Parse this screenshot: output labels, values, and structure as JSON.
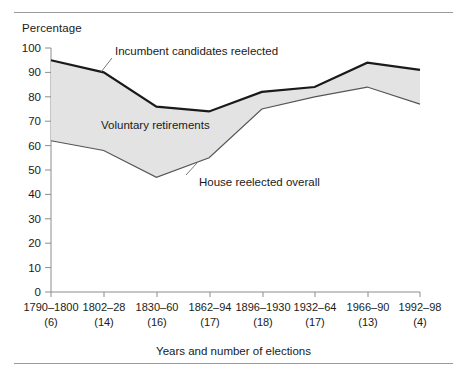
{
  "chart_data": {
    "type": "area",
    "title": "",
    "xlabel": "Years and number of elections",
    "ylabel": "Percentage",
    "ylim": [
      0,
      100
    ],
    "yticks": [
      0,
      10,
      20,
      30,
      40,
      50,
      60,
      70,
      80,
      90,
      100
    ],
    "grid": false,
    "legend_position": "inline-annotations",
    "categories": [
      "1790–1800",
      "1802–28",
      "1830–60",
      "1862–94",
      "1896–1930",
      "1932–64",
      "1966–90",
      "1992–98"
    ],
    "category_sublabels": [
      "(6)",
      "(14)",
      "(16)",
      "(17)",
      "(18)",
      "(17)",
      "(13)",
      "(4)"
    ],
    "series": [
      {
        "name": "Incumbent candidates reelected",
        "values": [
          95,
          90,
          76,
          74,
          82,
          84,
          94,
          91
        ]
      },
      {
        "name": "House reelected overall",
        "values": [
          62,
          58,
          47,
          55,
          75,
          80,
          84,
          77
        ]
      }
    ],
    "band": {
      "name": "Voluntary retirements",
      "between": [
        "Incumbent candidates reelected",
        "House reelected overall"
      ],
      "fill": "#e3e3e3"
    },
    "annotations": [
      {
        "id": "incumbent",
        "text": "Incumbent candidates reelected"
      },
      {
        "id": "voluntary",
        "text": "Voluntary retirements"
      },
      {
        "id": "house",
        "text": "House reelected overall"
      }
    ],
    "colors": {
      "upper_line": "#1a1a1a",
      "lower_line": "#555555",
      "band_fill": "#e3e3e3",
      "axis": "#8d8d8d",
      "text": "#1a1a1a",
      "rule": "#9a9a9a"
    }
  }
}
